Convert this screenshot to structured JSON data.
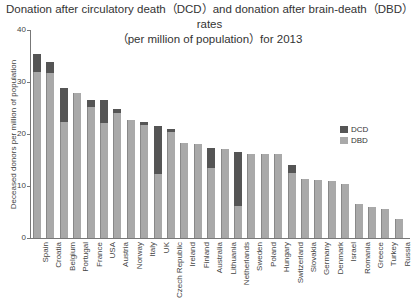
{
  "title_line1": "Donation after circulatory death（DCD）and donation after brain-death（DBD）rates",
  "title_line2": "（per million of population）for 2013",
  "chart_data": {
    "type": "bar",
    "stacked": true,
    "xlabel": "",
    "ylabel": "Deceased donors per million of population",
    "ylim": [
      0,
      40
    ],
    "yticks": [
      0,
      10,
      20,
      30,
      40
    ],
    "legend_position": "right",
    "categories": [
      "Spain",
      "Croatia",
      "Belgium",
      "Portugal",
      "France",
      "USA",
      "Austria",
      "Norway",
      "Italy",
      "UK",
      "Czech Republic",
      "Ireland",
      "Finland",
      "Australia",
      "Lithuania",
      "Netherlands",
      "Sweden",
      "Poland",
      "Hungary",
      "Switzerland",
      "Slovakia",
      "Germany",
      "Denmark",
      "Israel",
      "Romania",
      "Greece",
      "Turkey",
      "Russia"
    ],
    "series": [
      {
        "name": "DBD",
        "color": "#a9a9a9",
        "values": [
          32.0,
          31.7,
          22.3,
          27.9,
          25.2,
          22.2,
          24.1,
          22.6,
          21.8,
          12.3,
          20.4,
          18.3,
          18.0,
          13.4,
          17.1,
          6.2,
          16.2,
          16.2,
          16.2,
          12.5,
          11.4,
          11.2,
          10.9,
          10.4,
          6.5,
          6.0,
          5.6,
          3.7
        ]
      },
      {
        "name": "DCD",
        "color": "#555555",
        "values": [
          3.3,
          2.1,
          6.6,
          0,
          1.4,
          4.3,
          0.8,
          0,
          0.6,
          9.2,
          0.6,
          0,
          0,
          3.9,
          0,
          10.3,
          0,
          0,
          0,
          1.5,
          0,
          0,
          0,
          0,
          0,
          0,
          0,
          0
        ]
      }
    ]
  },
  "legend": [
    {
      "label": "DCD",
      "color": "#555555"
    },
    {
      "label": "DBD",
      "color": "#a9a9a9"
    }
  ]
}
